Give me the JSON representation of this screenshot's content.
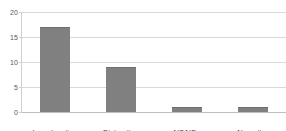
{
  "chart_data": {
    "type": "bar",
    "title": "",
    "subtitle": "",
    "xlabel": "",
    "ylabel": "",
    "categories": [
      "Ice, elevation",
      "Distraction",
      "NSAIDs",
      "Narcotics"
    ],
    "values": [
      17,
      9,
      1,
      1
    ],
    "ylim": [
      0,
      20
    ],
    "yticks": [
      0,
      5,
      10,
      15,
      20
    ],
    "ytick_labels": [
      "0",
      "5",
      "10",
      "15",
      "20"
    ],
    "grid": true,
    "grid_axis": "y",
    "legend": false,
    "legend_position": "none",
    "series": [
      {
        "name": "",
        "values": [
          17,
          9,
          1,
          1
        ]
      }
    ],
    "annotations": []
  },
  "style": {
    "bar_color": "#808080",
    "bar_edge_color": "#6e6e6e",
    "gridline_color": "#d9d9d9",
    "axis_color": "#d0d0d0",
    "baseline_color": "#bfbfbf",
    "tick_label_color": "#595959",
    "category_label_color": "#404040",
    "background_color": "#ffffff"
  },
  "axis": {
    "y_title": "",
    "x_title": ""
  }
}
